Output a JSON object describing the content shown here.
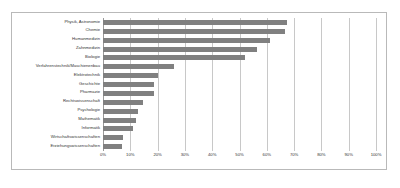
{
  "chart_data": {
    "type": "bar",
    "orientation": "horizontal",
    "title": "",
    "subtitle": "",
    "xlabel": "",
    "ylabel": "",
    "xlim": [
      0,
      100
    ],
    "xtick_labels": [
      "0%",
      "10%",
      "20%",
      "30%",
      "40%",
      "50%",
      "60%",
      "70%",
      "80%",
      "90%",
      "100%"
    ],
    "xtick_values": [
      0,
      10,
      20,
      30,
      40,
      50,
      60,
      70,
      80,
      90,
      100
    ],
    "grid": true,
    "legend": false,
    "bar_color": "#808080",
    "grid_color": "#c8c8c8",
    "categories": [
      "Physik, Astronomie",
      "Chemie",
      "Humanmedizin",
      "Zahnmedizin",
      "Biologie",
      "Verfahrenstechnik/Maschienenbau",
      "Elektrotechnik",
      "Geschichte",
      "Pharmazie",
      "Rechtswissenschaft",
      "Psychologie",
      "Mathematik",
      "Informatik",
      "Wirtschaftswissenschaften",
      "Erziehungswissenschaften"
    ],
    "values": [
      67.5,
      66.5,
      61,
      56.5,
      52,
      26,
      20,
      18.5,
      18.5,
      14.5,
      13,
      12,
      11,
      7.5,
      7
    ]
  },
  "artifact": {
    "bottom_right_text": ""
  }
}
